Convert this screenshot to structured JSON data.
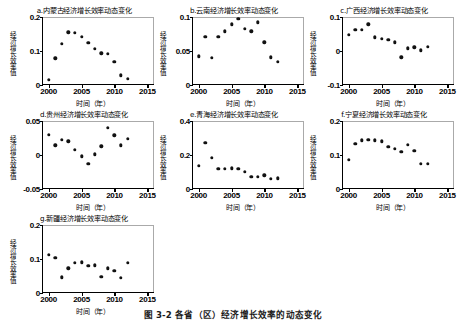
{
  "figure": {
    "caption": "图 3-2  各省（区）经济增长效率的动态变化",
    "xlabel": "时间（年）",
    "ylabel": "经济增长效率值"
  },
  "chart_data": [
    {
      "id": "a",
      "type": "scatter",
      "title": "a.内蒙古经济增长效率动态变化",
      "xlabel": "时间（年）",
      "ylabel": "经济增长效率值",
      "xlim": [
        1999,
        2016
      ],
      "ylim": [
        0,
        0.2
      ],
      "xticks": [
        "2000",
        "2005",
        "2010",
        "2015"
      ],
      "yticks": [
        "0",
        "0.1",
        "0.2"
      ],
      "x": [
        2000,
        2001,
        2002,
        2003,
        2004,
        2005,
        2006,
        2007,
        2008,
        2009,
        2010,
        2011,
        2012
      ],
      "values": [
        0.015,
        0.078,
        0.122,
        0.155,
        0.154,
        0.142,
        0.125,
        0.107,
        0.093,
        0.092,
        0.068,
        0.028,
        0.019
      ]
    },
    {
      "id": "b",
      "type": "scatter",
      "title": "b.云南经济增长效率动态变化",
      "xlabel": "时间（年）",
      "ylabel": "经济增长效率值",
      "xlim": [
        1999,
        2016
      ],
      "ylim": [
        0,
        0.1
      ],
      "xticks": [
        "2000",
        "2005",
        "2010",
        "2015"
      ],
      "yticks": [
        "0",
        "0.05",
        "0.1"
      ],
      "x": [
        2000,
        2001,
        2002,
        2003,
        2004,
        2005,
        2006,
        2007,
        2008,
        2009,
        2010,
        2011,
        2012
      ],
      "values": [
        0.042,
        0.071,
        0.04,
        0.071,
        0.079,
        0.089,
        0.097,
        0.083,
        0.079,
        0.092,
        0.063,
        0.041,
        0.034
      ]
    },
    {
      "id": "c",
      "type": "scatter",
      "title": "c.广西经济增长效率动态变化",
      "xlabel": "时间（年）",
      "ylabel": "经济增长效率值",
      "xlim": [
        1999,
        2016
      ],
      "ylim": [
        -0.1,
        0.1
      ],
      "xticks": [
        "2000",
        "2005",
        "2010",
        "2015"
      ],
      "yticks": [
        "-0.1",
        "0",
        "0.1"
      ],
      "x": [
        2000,
        2001,
        2002,
        2003,
        2004,
        2005,
        2006,
        2007,
        2008,
        2009,
        2010,
        2011,
        2012
      ],
      "values": [
        0.048,
        0.062,
        0.063,
        0.078,
        0.04,
        0.036,
        0.033,
        0.026,
        -0.018,
        0.008,
        0.011,
        0.002,
        0.013
      ]
    },
    {
      "id": "d",
      "type": "scatter",
      "title": "d.贵州经济增长效率动态变化",
      "xlabel": "时间（年）",
      "ylabel": "经济增长效率值",
      "xlim": [
        1999,
        2016
      ],
      "ylim": [
        -0.05,
        0.05
      ],
      "xticks": [
        "2000",
        "2005",
        "2010",
        "2015"
      ],
      "yticks": [
        "-0.05",
        "0",
        "0.05"
      ],
      "x": [
        2000,
        2001,
        2002,
        2003,
        2004,
        2005,
        2006,
        2007,
        2008,
        2009,
        2010,
        2011,
        2012
      ],
      "values": [
        0.03,
        0.014,
        0.022,
        0.02,
        0.008,
        -0.002,
        -0.013,
        0.001,
        0.013,
        0.04,
        0.029,
        0.014,
        0.024
      ]
    },
    {
      "id": "e",
      "type": "scatter",
      "title": "e.青海经济增长效率动态变化",
      "xlabel": "时间（年）",
      "ylabel": "经济增长效率值",
      "xlim": [
        1999,
        2016
      ],
      "ylim": [
        0,
        0.4
      ],
      "xticks": [
        "2000",
        "2005",
        "2010",
        "2015"
      ],
      "yticks": [
        "0",
        "0.2",
        "0.4"
      ],
      "x": [
        2000,
        2001,
        2002,
        2003,
        2004,
        2005,
        2006,
        2007,
        2008,
        2009,
        2010,
        2011,
        2012
      ],
      "values": [
        0.135,
        0.27,
        0.185,
        0.118,
        0.12,
        0.122,
        0.12,
        0.1,
        0.07,
        0.072,
        0.08,
        0.06,
        0.062
      ]
    },
    {
      "id": "f",
      "type": "scatter",
      "title": "f.宁夏经济增长效率动态变化",
      "xlabel": "时间（年）",
      "ylabel": "经济增长效率值",
      "xlim": [
        1999,
        2016
      ],
      "ylim": [
        0,
        0.2
      ],
      "xticks": [
        "2000",
        "2005",
        "2010",
        "2015"
      ],
      "yticks": [
        "0",
        "0.1",
        "0.2"
      ],
      "x": [
        2000,
        2001,
        2002,
        2003,
        2004,
        2005,
        2006,
        2007,
        2008,
        2009,
        2010,
        2011,
        2012
      ],
      "values": [
        0.085,
        0.133,
        0.143,
        0.145,
        0.143,
        0.14,
        0.125,
        0.118,
        0.11,
        0.13,
        0.112,
        0.075,
        0.074
      ]
    },
    {
      "id": "g",
      "type": "scatter",
      "title": "g.新疆经济增长效率动态变化",
      "xlabel": "时间（年）",
      "ylabel": "经济增长效率值",
      "xlim": [
        1999,
        2016
      ],
      "ylim": [
        0,
        0.2
      ],
      "xticks": [
        "2000",
        "2005",
        "2010",
        "2015"
      ],
      "yticks": [
        "0",
        "0.1",
        "0.2"
      ],
      "x": [
        2000,
        2001,
        2002,
        2003,
        2004,
        2005,
        2006,
        2007,
        2008,
        2009,
        2010,
        2011,
        2012
      ],
      "values": [
        0.112,
        0.103,
        0.046,
        0.073,
        0.088,
        0.09,
        0.08,
        0.082,
        0.048,
        0.073,
        0.066,
        0.045,
        0.088
      ]
    }
  ]
}
